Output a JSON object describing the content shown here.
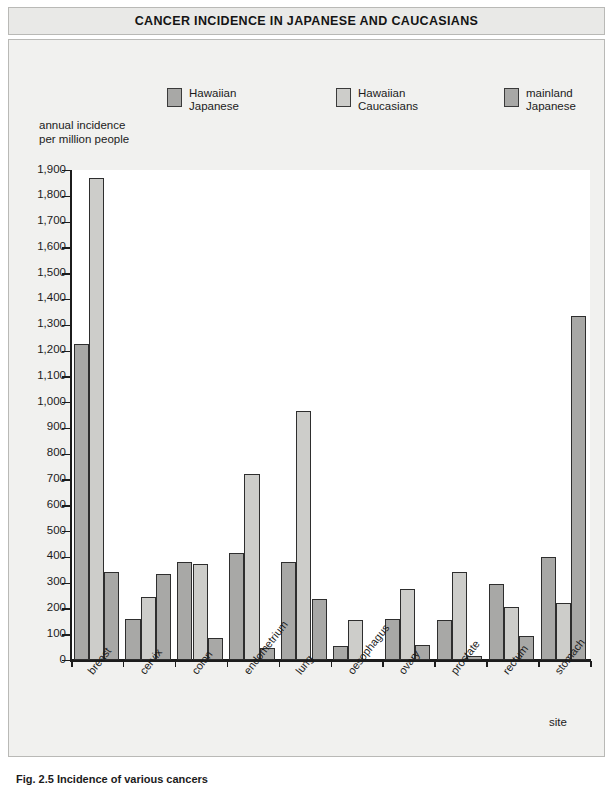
{
  "title": "CANCER INCIDENCE IN JAPANESE AND CAUCASIANS",
  "caption": "Fig. 2.5  Incidence of various cancers",
  "y_axis_caption": "annual incidence\nper million people",
  "x_axis_title": "site",
  "legend": [
    {
      "label": "Hawaiian\nJapanese",
      "color": "#a8a8a6"
    },
    {
      "label": "Hawaiian\nCaucasians",
      "color": "#cdcdca"
    },
    {
      "label": "mainland\nJapanese",
      "color": "#a8a8a6"
    }
  ],
  "chart_data": {
    "type": "bar",
    "title": "CANCER INCIDENCE IN JAPANESE AND CAUCASIANS",
    "xlabel": "site",
    "ylabel": "annual incidence per million people",
    "ylim": [
      0,
      1900
    ],
    "ytick_labels": [
      "0",
      "100",
      "200",
      "300",
      "400",
      "500",
      "600",
      "700",
      "800",
      "900",
      "1,000",
      "1,100",
      "1,200",
      "1,300",
      "1,400",
      "1,500",
      "1,600",
      "1,700",
      "1,800",
      "1,900"
    ],
    "ytick_values": [
      0,
      100,
      200,
      300,
      400,
      500,
      600,
      700,
      800,
      900,
      1000,
      1100,
      1200,
      1300,
      1400,
      1500,
      1600,
      1700,
      1800,
      1900
    ],
    "grid": false,
    "legend_position": "top",
    "categories": [
      "breast",
      "cervix",
      "colon",
      "endometrium",
      "lung",
      "oesophagus",
      "ovary",
      "prostate",
      "rectum",
      "stomach"
    ],
    "series": [
      {
        "name": "Hawaiian Japanese",
        "color": "#a8a8a6",
        "values": [
          1225,
          160,
          380,
          415,
          380,
          55,
          160,
          155,
          295,
          400
        ]
      },
      {
        "name": "Hawaiian Caucasians",
        "color": "#cdcdca",
        "values": [
          1870,
          245,
          372,
          720,
          965,
          155,
          275,
          340,
          205,
          220
        ]
      },
      {
        "name": "mainland Japanese",
        "color": "#a8a8a6",
        "values": [
          340,
          335,
          85,
          45,
          235,
          null,
          60,
          15,
          95,
          1335
        ]
      }
    ]
  }
}
